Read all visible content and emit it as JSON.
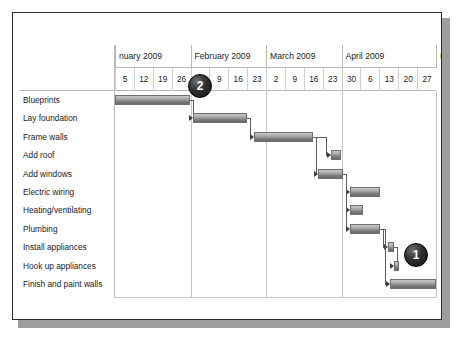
{
  "slide": {
    "background_color": "#ffffff",
    "border_color": "#2b2b2b",
    "shadow_color": "#9d9d9d"
  },
  "chart_data": {
    "type": "bar",
    "chart_kind": "gantt",
    "title": "",
    "xlabel": "",
    "ylabel": "",
    "grid": true,
    "legend": "none",
    "months": [
      {
        "label": "nuary 2009",
        "start_week_index": 0,
        "weeks": 4
      },
      {
        "label": "February 2009",
        "start_week_index": 4,
        "weeks": 4
      },
      {
        "label": "March 2009",
        "start_week_index": 8,
        "weeks": 4
      },
      {
        "label": "April 2009",
        "start_week_index": 12,
        "weeks": 5
      },
      {
        "label": "I",
        "start_week_index": 17,
        "weeks": 1
      }
    ],
    "week_ticks": [
      "5",
      "12",
      "19",
      "26",
      "2",
      "9",
      "16",
      "23",
      "2",
      "9",
      "16",
      "23",
      "30",
      "6",
      "13",
      "20",
      "27"
    ],
    "categories": [
      "Blueprints",
      "Lay foundation",
      "Frame walls",
      "Add roof",
      "Add windows",
      "Electric wiring",
      "Heating/ventilating",
      "Plumbing",
      "Install appliances",
      "Hook up appliances",
      "Finish and paint walls"
    ],
    "bars": [
      {
        "task": "Blueprints",
        "start_week": 0.0,
        "end_week": 3.95,
        "bar_color": "#8a8a8a"
      },
      {
        "task": "Lay foundation",
        "start_week": 4.15,
        "end_week": 7.0,
        "bar_color": "#8a8a8a"
      },
      {
        "task": "Frame walls",
        "start_week": 7.35,
        "end_week": 10.5,
        "bar_color": "#8a8a8a"
      },
      {
        "task": "Add roof",
        "start_week": 11.45,
        "end_week": 11.95,
        "bar_color": "#8a8a8a"
      },
      {
        "task": "Add windows",
        "start_week": 10.75,
        "end_week": 12.05,
        "bar_color": "#8a8a8a"
      },
      {
        "task": "Electric wiring",
        "start_week": 12.45,
        "end_week": 14.05,
        "bar_color": "#8a8a8a"
      },
      {
        "task": "Heating/ventilating",
        "start_week": 12.45,
        "end_week": 13.15,
        "bar_color": "#8a8a8a"
      },
      {
        "task": "Plumbing",
        "start_week": 12.45,
        "end_week": 14.05,
        "bar_color": "#8a8a8a"
      },
      {
        "task": "Install appliances",
        "start_week": 14.45,
        "end_week": 14.75,
        "bar_color": "#8a8a8a"
      },
      {
        "task": "Hook up appliances",
        "start_week": 14.8,
        "end_week": 15.05,
        "bar_color": "#8a8a8a"
      },
      {
        "task": "Finish and paint walls",
        "start_week": 14.55,
        "end_week": 17.0,
        "bar_color": "#8a8a8a"
      }
    ],
    "axis_note": "Weekly tick columns; each column spans one week"
  },
  "callouts": [
    {
      "label": "2",
      "name": "callout-badge-2",
      "x": 187,
      "y": 73
    },
    {
      "label": "1",
      "name": "callout-badge-1",
      "x": 403,
      "y": 242
    }
  ]
}
